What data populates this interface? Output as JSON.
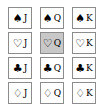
{
  "cards": [
    {
      "suit": "♠",
      "rank": "J",
      "selected": false
    },
    {
      "suit": "♠",
      "rank": "Q",
      "selected": false
    },
    {
      "suit": "♠",
      "rank": "K",
      "selected": false
    },
    {
      "suit": "♡",
      "rank": "J",
      "selected": false
    },
    {
      "suit": "♡",
      "rank": "Q",
      "selected": true
    },
    {
      "suit": "♡",
      "rank": "K",
      "selected": false
    },
    {
      "suit": "♣",
      "rank": "J",
      "selected": false
    },
    {
      "suit": "♣",
      "rank": "Q",
      "selected": false
    },
    {
      "suit": "♣",
      "rank": "K",
      "selected": false
    },
    {
      "suit": "♢",
      "rank": "J",
      "selected": false
    },
    {
      "suit": "♢",
      "rank": "Q",
      "selected": false
    },
    {
      "suit": "♢",
      "rank": "K",
      "selected": false
    }
  ]
}
